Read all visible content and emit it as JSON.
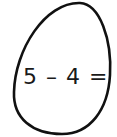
{
  "egg": {
    "stroke_color": "#111111",
    "fill_color": "#ffffff"
  },
  "equation": {
    "text": "5 – 4 ="
  }
}
